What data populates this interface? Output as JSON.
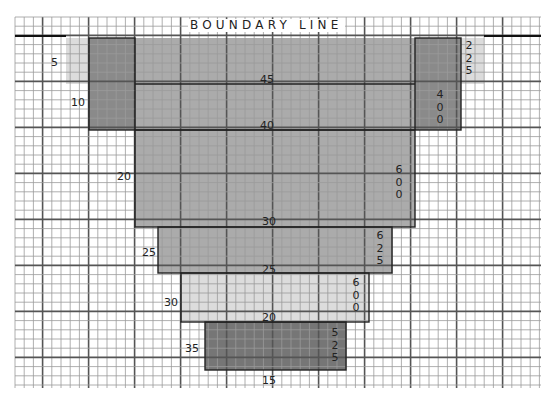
{
  "title": "BOUNDARY LINE",
  "colors": {
    "grid_thin": "#9a9a9a",
    "grid_thick": "#555555",
    "band_light": "#dcdcdc",
    "band_medium": "#ababab",
    "band_dark": "#8a8a8a",
    "band_darkest": "#767676",
    "outline": "#222222"
  },
  "grid": {
    "x0": 15,
    "y0": 17,
    "x1": 541,
    "y1": 388,
    "cell": 9.2,
    "major_every": 5
  },
  "bands": [
    {
      "id": "band-5",
      "x": 66,
      "y": 38,
      "w": 418,
      "h": 46,
      "fill": "#dcdcdc"
    },
    {
      "id": "band-main-upper",
      "x": 135,
      "y": 38,
      "w": 280,
      "h": 189,
      "fill": "#ababab"
    },
    {
      "id": "band-10-left",
      "x": 89,
      "y": 38,
      "w": 46,
      "h": 92,
      "fill": "#8a8a8a"
    },
    {
      "id": "band-10-right",
      "x": 415,
      "y": 38,
      "w": 46,
      "h": 92,
      "fill": "#8a8a8a"
    },
    {
      "id": "band-25",
      "x": 158,
      "y": 227,
      "w": 234,
      "h": 46,
      "fill": "#ababab"
    },
    {
      "id": "band-30",
      "x": 181,
      "y": 273,
      "w": 188,
      "h": 49,
      "fill": "#dcdcdc"
    },
    {
      "id": "band-35",
      "x": 205,
      "y": 322,
      "w": 141,
      "h": 48,
      "fill": "#767676"
    }
  ],
  "contour_labels": [
    {
      "text": "5",
      "x": 51,
      "y": 57
    },
    {
      "text": "10",
      "x": 71,
      "y": 97
    },
    {
      "text": "45",
      "x": 260,
      "y": 74
    },
    {
      "text": "40",
      "x": 260,
      "y": 120
    },
    {
      "text": "20",
      "x": 117,
      "y": 171
    },
    {
      "text": "30",
      "x": 262,
      "y": 216
    },
    {
      "text": "25",
      "x": 142,
      "y": 247
    },
    {
      "text": "25",
      "x": 262,
      "y": 264
    },
    {
      "text": "30",
      "x": 164,
      "y": 297
    },
    {
      "text": "20",
      "x": 262,
      "y": 312
    },
    {
      "text": "35",
      "x": 185,
      "y": 343
    },
    {
      "text": "15",
      "x": 262,
      "y": 375
    }
  ],
  "area_labels": [
    {
      "text": "2\n2\n5",
      "x": 464,
      "y": 40
    },
    {
      "text": "4\n0\n0",
      "x": 435,
      "y": 89
    },
    {
      "text": "6\n0\n0",
      "x": 394,
      "y": 164
    },
    {
      "text": "6\n2\n5",
      "x": 375,
      "y": 230
    },
    {
      "text": "6\n0\n0",
      "x": 351,
      "y": 277
    },
    {
      "text": "5\n2\n5",
      "x": 330,
      "y": 327
    }
  ],
  "boundary_segments": [
    {
      "x1": 15,
      "y1": 36,
      "x2": 66,
      "y2": 36
    },
    {
      "x1": 484,
      "y1": 36,
      "x2": 541,
      "y2": 36
    }
  ]
}
